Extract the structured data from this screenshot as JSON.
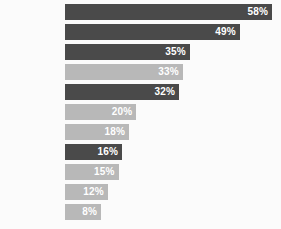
{
  "chart_data": {
    "type": "bar",
    "orientation": "horizontal",
    "title": "",
    "subtitle": "",
    "xlabel": "",
    "ylabel": "",
    "xlim": [
      0,
      58
    ],
    "grid": false,
    "legend": false,
    "value_suffix": "%",
    "categories": [
      "",
      "",
      "",
      "",
      "",
      "",
      "",
      "",
      "",
      "",
      ""
    ],
    "values": [
      58,
      49,
      35,
      33,
      32,
      20,
      18,
      16,
      15,
      12,
      8
    ],
    "value_labels": [
      "58%",
      "49%",
      "35%",
      "33%",
      "32%",
      "20%",
      "18%",
      "16%",
      "15%",
      "12%",
      "8%"
    ],
    "bar_shades": [
      "dark",
      "dark",
      "dark",
      "light",
      "dark",
      "light",
      "light",
      "dark",
      "light",
      "light",
      "light"
    ],
    "bars": [
      {
        "label": "58%",
        "value": 58,
        "shade": "dark"
      },
      {
        "label": "49%",
        "value": 49,
        "shade": "dark"
      },
      {
        "label": "35%",
        "value": 35,
        "shade": "dark"
      },
      {
        "label": "33%",
        "value": 33,
        "shade": "light"
      },
      {
        "label": "32%",
        "value": 32,
        "shade": "dark"
      },
      {
        "label": "20%",
        "value": 20,
        "shade": "light"
      },
      {
        "label": "18%",
        "value": 18,
        "shade": "light"
      },
      {
        "label": "16%",
        "value": 16,
        "shade": "dark"
      },
      {
        "label": "15%",
        "value": 15,
        "shade": "light"
      },
      {
        "label": "12%",
        "value": 12,
        "shade": "light"
      },
      {
        "label": "8%",
        "value": 8,
        "shade": "light"
      }
    ]
  },
  "edge_label": {
    "text": "t"
  },
  "colors": {
    "background": "#fbfbfb",
    "bar_dark": "#4a4a4a",
    "bar_light": "#b8b8b8",
    "value_text": "#ffffff"
  }
}
